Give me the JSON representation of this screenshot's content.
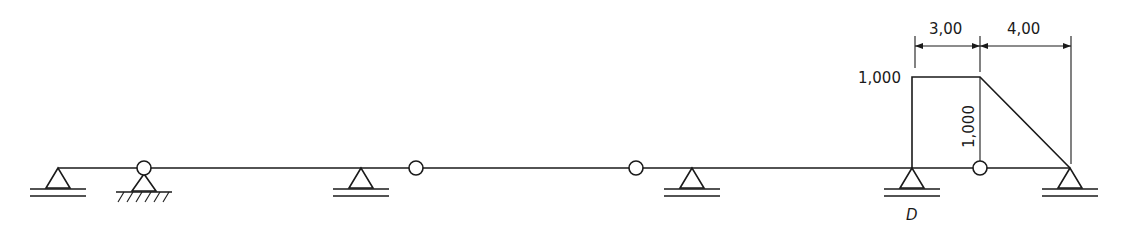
{
  "diagram": {
    "type": "structural-beam-influence-line",
    "beam_y": 168,
    "supports": [
      {
        "id": "s1",
        "kind": "roller",
        "x": 58
      },
      {
        "id": "s2",
        "kind": "pinned-fixed-ground",
        "x": 144
      },
      {
        "id": "s3",
        "kind": "roller",
        "x": 361
      },
      {
        "id": "s4",
        "kind": "roller",
        "x": 692
      },
      {
        "id": "D",
        "kind": "roller",
        "x": 912,
        "label": "D"
      },
      {
        "id": "s6",
        "kind": "roller",
        "x": 1070
      }
    ],
    "hinges": [
      {
        "x": 144
      },
      {
        "x": 416
      },
      {
        "x": 636
      },
      {
        "x": 980
      }
    ],
    "ordinate_diagram": {
      "left_label": "1,000",
      "vertical_label": "1,000",
      "points": [
        [
          912,
          168
        ],
        [
          912,
          77
        ],
        [
          980,
          77
        ],
        [
          1070,
          168
        ]
      ]
    },
    "dimensions": [
      {
        "label": "3,00",
        "x1": 912,
        "x2": 980
      },
      {
        "label": "4,00",
        "x1": 980,
        "x2": 1070
      }
    ],
    "support_label_D": "D"
  }
}
